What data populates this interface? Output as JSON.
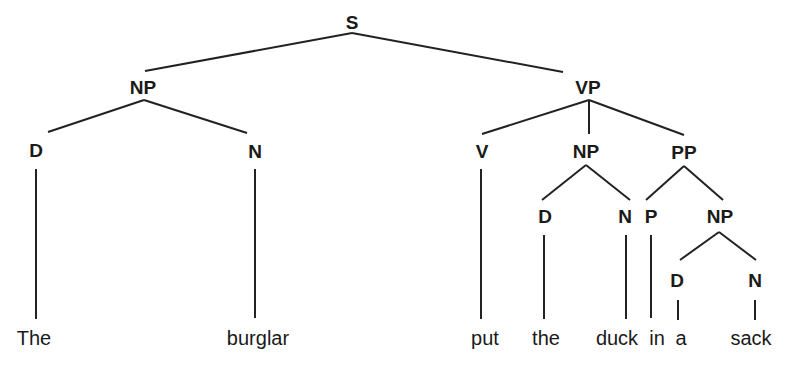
{
  "diagram": {
    "type": "syntax-tree",
    "sentence": "The burglar put the duck in a sack",
    "nodes": {
      "s": {
        "label": "S"
      },
      "np_subj": {
        "label": "NP"
      },
      "d_subj": {
        "label": "D"
      },
      "n_subj": {
        "label": "N"
      },
      "vp": {
        "label": "VP"
      },
      "v": {
        "label": "V"
      },
      "np_obj": {
        "label": "NP"
      },
      "pp": {
        "label": "PP"
      },
      "d_obj": {
        "label": "D"
      },
      "n_obj": {
        "label": "N"
      },
      "p": {
        "label": "P"
      },
      "np_pp": {
        "label": "NP"
      },
      "d_pp": {
        "label": "D"
      },
      "n_pp": {
        "label": "N"
      }
    },
    "words": {
      "the_1": "The",
      "burglar": "burglar",
      "put": "put",
      "the_2": "the",
      "duck": "duck",
      "in": "in",
      "a": "a",
      "sack": "sack"
    },
    "structure": "[S [NP [D The] [N burglar]] [VP [V put] [NP [D the] [N duck]] [PP [P in] [NP [D a] [N sack]]]]]"
  }
}
